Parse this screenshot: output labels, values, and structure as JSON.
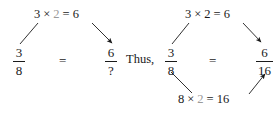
{
  "figure": {
    "colors": {
      "ink": "#1a1a1a",
      "faded_factor": "#9a9a9a",
      "background": "#ffffff"
    }
  },
  "diagram_left": {
    "top_equation": {
      "operand_a": "3",
      "times": "×",
      "operand_b": "2",
      "equals": "=",
      "result": "6",
      "operand_b_color": "#9a9a9a"
    },
    "left_fraction": {
      "numerator": "3",
      "denominator": "8"
    },
    "relation": "=",
    "right_fraction": {
      "numerator": "6",
      "denominator": "?"
    }
  },
  "connector": {
    "label": "Thus,"
  },
  "diagram_right": {
    "top_equation": {
      "operand_a": "3",
      "times": "×",
      "operand_b": "2",
      "equals": "=",
      "result": "6",
      "operand_b_color": "#1a1a1a"
    },
    "bottom_equation": {
      "operand_a": "8",
      "times": "×",
      "operand_b": "2",
      "equals": "=",
      "result": "16",
      "operand_b_color": "#9a9a9a"
    },
    "left_fraction": {
      "numerator": "3",
      "denominator": "8"
    },
    "relation": "=",
    "right_fraction": {
      "numerator": "6",
      "denominator": "16"
    }
  }
}
